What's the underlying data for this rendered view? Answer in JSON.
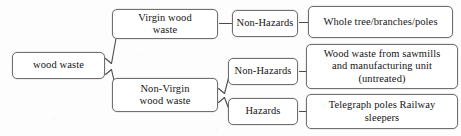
{
  "diagram": {
    "type": "tree-flowchart",
    "orientation": "left-to-right",
    "background_color": "#fdfdfd",
    "box_border_color": "#6f6f6f",
    "box_fill_color": "#ffffff",
    "text_color": "#151515",
    "nodes": {
      "root": "wood waste",
      "virgin": "Virgin  wood\nwaste",
      "non_virgin": "Non-Virgin\nwood waste",
      "virgin_non_hazards": "Non-Hazards",
      "non_virgin_non_hazards": "Non-Hazards",
      "non_virgin_hazards": "Hazards",
      "whole_tree": "Whole  tree/branches/poles",
      "sawmills": "Wood waste from  sawmills\nand manufacturing  unit\n(untreated)",
      "telegraph": "Telegraph  poles Railway\nsleepers"
    },
    "connectors": [
      {
        "name": "root-to-virgin",
        "style": "brace-line"
      },
      {
        "name": "root-to-non-virgin",
        "style": "brace-line"
      },
      {
        "name": "virgin-to-non-hazards",
        "style": "dash"
      },
      {
        "name": "non-virgin-to-non-hazards",
        "style": "brace-line"
      },
      {
        "name": "non-virgin-to-hazards",
        "style": "brace-line"
      },
      {
        "name": "non-hazards-to-whole-tree",
        "style": "dash"
      },
      {
        "name": "non-hazards-to-sawmills",
        "style": "dash"
      },
      {
        "name": "hazards-to-telegraph",
        "style": "dash"
      }
    ]
  }
}
